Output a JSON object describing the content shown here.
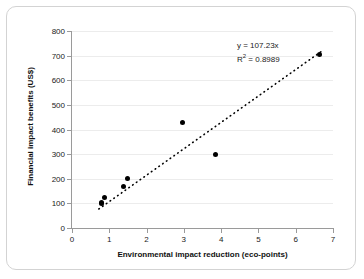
{
  "chart_data": {
    "type": "scatter",
    "title": "",
    "xlabel": "Environmental impact reduction (eco-points)",
    "ylabel": "Financial impact benefits  (US$)",
    "xlim": [
      0,
      7
    ],
    "ylim": [
      0,
      800
    ],
    "xticks": [
      0,
      1,
      2,
      3,
      4,
      5,
      6,
      7
    ],
    "yticks": [
      0,
      100,
      200,
      300,
      400,
      500,
      600,
      700,
      800
    ],
    "xtick_labels": [
      "0",
      "1",
      "2",
      "3",
      "4",
      "5",
      "6",
      "7"
    ],
    "ytick_labels": [
      "0",
      "100",
      "200",
      "300",
      "400",
      "500",
      "600",
      "700",
      "800"
    ],
    "grid": "horizontal",
    "legend": "none",
    "marker": "filled-circle",
    "marker_color": "#000000",
    "points": [
      {
        "x": 0.78,
        "y": 98
      },
      {
        "x": 0.8,
        "y": 105
      },
      {
        "x": 0.86,
        "y": 122
      },
      {
        "x": 1.38,
        "y": 170
      },
      {
        "x": 1.5,
        "y": 200
      },
      {
        "x": 2.97,
        "y": 430
      },
      {
        "x": 3.85,
        "y": 298
      },
      {
        "x": 6.65,
        "y": 705
      }
    ],
    "trendline": {
      "type": "linear-through-origin",
      "slope": 107.23,
      "intercept": 0,
      "style": "dotted",
      "color": "#000000",
      "x_start": 0.72,
      "x_end": 6.68
    },
    "annotations": {
      "equation": "y = 107.23x",
      "r_squared_prefix": "R",
      "r_squared_exponent": "2",
      "r_squared_value": " = 0.8989"
    }
  },
  "colors": {
    "background": "#ffffff",
    "frame_border": "#d3d3d3",
    "axis": "#9a9a9a",
    "gridline": "#ececec",
    "text": "#222222",
    "marker": "#000000"
  }
}
